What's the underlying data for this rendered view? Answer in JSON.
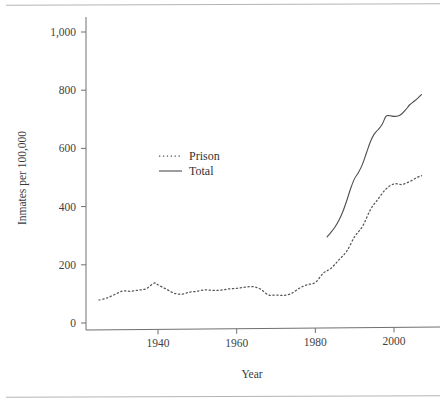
{
  "figure": {
    "has_top_rule": true,
    "has_bottom_rule": true,
    "background_color": "#ffffff",
    "ink_color": "#3a3a3a"
  },
  "chart_data": {
    "type": "line",
    "title": "",
    "xlabel": "Year",
    "ylabel": "Inmates per 100,000",
    "xlim": [
      1925,
      2008
    ],
    "ylim": [
      0,
      1050
    ],
    "xticks": [
      1940,
      1960,
      1980,
      2000
    ],
    "xticklabels": [
      "1940",
      "1960",
      "1980",
      "2000"
    ],
    "yticks": [
      0,
      200,
      400,
      600,
      800,
      1000
    ],
    "yticklabels": [
      "0",
      "200",
      "400",
      "600",
      "800",
      "1,000"
    ],
    "grid": false,
    "legend_position": "center-left",
    "legend": [
      {
        "name": "Prison",
        "style": "dotted",
        "color": "#555555"
      },
      {
        "name": "Total",
        "style": "solid",
        "color": "#4d4d4d"
      }
    ],
    "series": [
      {
        "name": "Prison",
        "style": "dotted",
        "color": "#555555",
        "x": [
          1925,
          1927,
          1929,
          1931,
          1933,
          1935,
          1937,
          1939,
          1940,
          1942,
          1944,
          1946,
          1948,
          1950,
          1952,
          1954,
          1956,
          1958,
          1960,
          1962,
          1964,
          1966,
          1968,
          1970,
          1972,
          1974,
          1976,
          1978,
          1980,
          1982,
          1984,
          1986,
          1988,
          1990,
          1992,
          1994,
          1996,
          1998,
          2000,
          2002,
          2004,
          2006,
          2007
        ],
        "y": [
          79,
          86,
          98,
          110,
          109,
          113,
          118,
          137,
          131,
          117,
          103,
          99,
          106,
          109,
          114,
          112,
          113,
          117,
          119,
          123,
          125,
          117,
          97,
          96,
          95,
          102,
          120,
          132,
          139,
          171,
          188,
          217,
          247,
          297,
          332,
          389,
          427,
          461,
          478,
          476,
          486,
          501,
          506
        ],
        "ylabel_units": "per 100,000"
      },
      {
        "name": "Total",
        "style": "solid",
        "color": "#4d4d4d",
        "x": [
          1983,
          1984,
          1985,
          1986,
          1987,
          1988,
          1989,
          1990,
          1991,
          1992,
          1993,
          1994,
          1995,
          1996,
          1997,
          1998,
          1999,
          2000,
          2001,
          2002,
          2003,
          2004,
          2005,
          2006,
          2007
        ],
        "y": [
          296,
          312,
          330,
          353,
          383,
          421,
          463,
          497,
          518,
          546,
          585,
          623,
          650,
          665,
          683,
          711,
          712,
          710,
          711,
          719,
          733,
          750,
          761,
          772,
          785
        ],
        "ylabel_units": "per 100,000"
      }
    ]
  }
}
